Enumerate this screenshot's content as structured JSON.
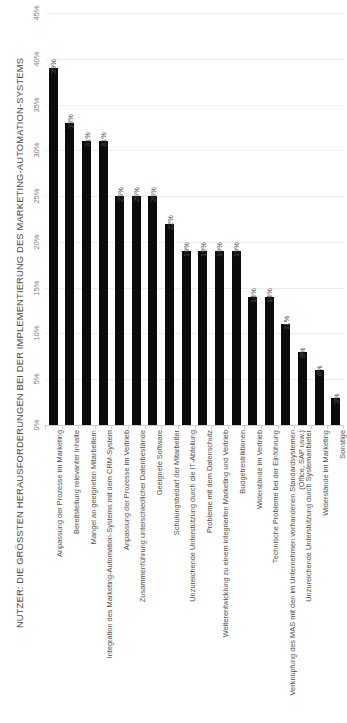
{
  "chart_data": {
    "type": "bar",
    "title": "NUTZER: DIE GRÖSSTEN HERAUSFORDERUNGEN BEI DER IMPLEMENTIERUNG DES MARKETING-AUTOMATION-SYSTEMS",
    "xlabel": "",
    "ylabel": "",
    "ylim": [
      0,
      45
    ],
    "grid": true,
    "legend": false,
    "orientation": "vertical",
    "bar_color": "#0b0b0b",
    "gridline_color": "#ededed",
    "axis_color": "#cfcfcf",
    "label_color": "#4f4f4f",
    "tick_labels": [
      "0%",
      "5%",
      "10%",
      "15%",
      "20%",
      "25%",
      "30%",
      "35%",
      "40%",
      "45%"
    ],
    "tick_values": [
      0,
      5,
      10,
      15,
      20,
      25,
      30,
      35,
      40,
      45
    ],
    "value_suffix": "%",
    "categories": [
      "Anpassung der Prozesse im Marketing",
      "Bereitstellung relevanter Inhalte",
      "Mangel an geeigneten Mitarbeitern",
      "Integration des Marketing-Automation-Systems mit dem CRM-System",
      "Anpassung der Prozesse im Vertrieb",
      "Zusammenführung unterschiedlicher Datenbestände",
      "Geeignete Software",
      "Schulungsbedarf der Mitarbeiter",
      "Unzureichende Unterstützung durch die IT-Abteilung",
      "Probleme mit dem Datenschutz",
      "Weiterentwicklung zu einem integrierten Marketing und Vertrieb",
      "Budgetrestriktionen",
      "Widerstände im Vertrieb",
      "Technische Probleme bei der Einführung",
      "Verknüpfung des MAS mit den im Unternehmen vorhandenen Standardsystemen (Office, SAP usw.)",
      "Unzureichende Unterstützung durch Systemanbieter",
      "Widerstände im Marketing",
      "Sonstige"
    ],
    "values": [
      39,
      33,
      31,
      31,
      25,
      25,
      25,
      22,
      19,
      19,
      19,
      19,
      14,
      14,
      11,
      8,
      6,
      3
    ],
    "data_labels": [
      "39%",
      "33%",
      "31%",
      "31%",
      "25%",
      "25%",
      "25%",
      "22%",
      "19%",
      "19%",
      "19%",
      "19%",
      "14%",
      "14%",
      "11%",
      "8%",
      "6%",
      "3%"
    ]
  }
}
